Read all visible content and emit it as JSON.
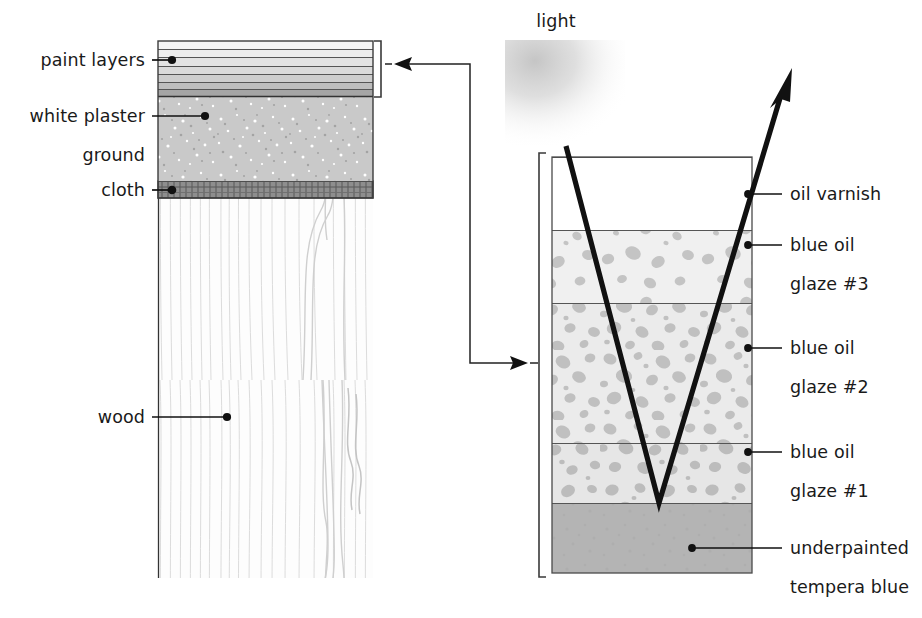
{
  "figure": {
    "background_color": "#ffffff",
    "ink_color": "#111111"
  },
  "light_label": {
    "text": "light",
    "x": 556,
    "y": 27
  },
  "left_diagram": {
    "name": "painting-cross-section",
    "block": {
      "x": 158,
      "y": 41,
      "width": 215,
      "height": 537
    },
    "labels": [
      {
        "id": "paint-layers",
        "text": "paint layers",
        "text_x": 145,
        "text_y": 66,
        "leader_from_x": 152,
        "leader_to_x": 172,
        "leader_y": 60,
        "dot_x": 172,
        "dot_y": 60
      },
      {
        "id": "white-plaster",
        "text": "white plaster",
        "text_x": 145,
        "text_y": 122,
        "leader_from_x": 152,
        "leader_to_x": 205,
        "leader_y": 116,
        "dot_x": 205,
        "dot_y": 116
      },
      {
        "id": "ground",
        "text": "ground",
        "text_x": 145,
        "text_y": 161,
        "leader_from_x": null,
        "leader_to_x": null,
        "leader_y": null,
        "dot_x": null,
        "dot_y": null
      },
      {
        "id": "cloth",
        "text": "cloth",
        "text_x": 145,
        "text_y": 196,
        "leader_from_x": 152,
        "leader_to_x": 172,
        "leader_y": 190,
        "dot_x": 172,
        "dot_y": 190
      },
      {
        "id": "wood",
        "text": "wood",
        "text_x": 145,
        "text_y": 423,
        "leader_from_x": 152,
        "leader_to_x": 227,
        "leader_y": 417,
        "dot_x": 227,
        "dot_y": 417
      }
    ],
    "layers": [
      {
        "id": "paint-band-1",
        "label": "paint layer 1",
        "y": 41,
        "height": 8,
        "color": "#f4f4f4"
      },
      {
        "id": "paint-band-2",
        "label": "paint layer 2",
        "y": 49,
        "height": 8,
        "color": "#ededed"
      },
      {
        "id": "paint-band-3",
        "label": "paint layer 3",
        "y": 57,
        "height": 9,
        "color": "#e4e4e4"
      },
      {
        "id": "paint-band-4",
        "label": "paint layer 4",
        "y": 66,
        "height": 8,
        "color": "#dcdcdc"
      },
      {
        "id": "paint-band-5",
        "label": "paint layer 5",
        "y": 74,
        "height": 8,
        "color": "#cfcfcf"
      },
      {
        "id": "paint-band-6",
        "label": "paint layer 6",
        "y": 82,
        "height": 7,
        "color": "#c2c2c2"
      },
      {
        "id": "paint-band-7",
        "label": "paint layer 7",
        "y": 89,
        "height": 8,
        "color": "#a8a8a8"
      },
      {
        "id": "ground-layer",
        "label": "white plaster ground",
        "y": 97,
        "height": 84,
        "color": "#c9c9c9"
      },
      {
        "id": "cloth-layer",
        "label": "cloth",
        "y": 181,
        "height": 17,
        "color": "#8a8a8a"
      },
      {
        "id": "wood-layer",
        "label": "wood",
        "y": 198,
        "height": 380,
        "color": "#fcfcfc"
      }
    ],
    "bracket": {
      "x": 381,
      "y_top": 41,
      "y_bottom": 97
    }
  },
  "connector": {
    "name": "magnification-connector",
    "description": "arrow linking paint layers bracket to magnified glaze stack",
    "arrow_left_tip_x": 394,
    "arrow_left_y": 64,
    "corner_x": 470,
    "arrow_right_tip_x": 528,
    "arrow_right_y": 363
  },
  "right_diagram": {
    "name": "glaze-stack-magnified",
    "block": {
      "x": 552,
      "y": 157,
      "width": 200,
      "height": 416
    },
    "bracket": {
      "x": 539,
      "y_top": 153,
      "y_bottom": 577
    },
    "layers": [
      {
        "id": "oil-varnish",
        "label": "oil varnish",
        "y": 157,
        "height": 73,
        "color": "#ffffff",
        "speckles": false,
        "speckle_density": 0
      },
      {
        "id": "blue-oil-glaze-3",
        "label": "blue oil glaze #3",
        "y": 230,
        "height": 73,
        "color": "#f0f0f0",
        "speckles": true,
        "speckle_density": 11
      },
      {
        "id": "blue-oil-glaze-2",
        "label": "blue oil glaze #2",
        "y": 303,
        "height": 140,
        "color": "#ebebeb",
        "speckles": true,
        "speckle_density": 30
      },
      {
        "id": "blue-oil-glaze-1",
        "label": "blue oil glaze #1",
        "y": 443,
        "height": 60,
        "color": "#e6e6e6",
        "speckles": true,
        "speckle_density": 20
      },
      {
        "id": "underpainted-tempera-blue",
        "label": "underpainted tempera blue",
        "y": 503,
        "height": 70,
        "color": "#b4b4b4",
        "speckles": false,
        "speckle_density": 0
      }
    ],
    "labels": [
      {
        "id": "oil-varnish",
        "lines": [
          "oil varnish"
        ],
        "text_x": 790,
        "text_y": 200,
        "leader_from_x": 782,
        "leader_to_x": 748,
        "leader_y": 194,
        "dot_x": 748,
        "dot_y": 194
      },
      {
        "id": "blue-oil-glaze-3",
        "lines": [
          "blue oil",
          "glaze #3"
        ],
        "text_x": 790,
        "text_y": 251,
        "leader_from_x": 782,
        "leader_to_x": 748,
        "leader_y": 245,
        "dot_x": 748,
        "dot_y": 245
      },
      {
        "id": "blue-oil-glaze-2",
        "lines": [
          "blue oil",
          "glaze #2"
        ],
        "text_x": 790,
        "text_y": 354,
        "leader_from_x": 782,
        "leader_to_x": 748,
        "leader_y": 348,
        "dot_x": 748,
        "dot_y": 348
      },
      {
        "id": "blue-oil-glaze-1",
        "lines": [
          "blue oil",
          "glaze #1"
        ],
        "text_x": 790,
        "text_y": 458,
        "leader_from_x": 782,
        "leader_to_x": 748,
        "leader_y": 452,
        "dot_x": 748,
        "dot_y": 452
      },
      {
        "id": "underpainted-tempera-blue",
        "lines": [
          "underpainted",
          "tempera blue"
        ],
        "text_x": 790,
        "text_y": 554,
        "leader_from_x": 782,
        "leader_to_x": 692,
        "leader_y": 548,
        "dot_x": 692,
        "dot_y": 548
      }
    ],
    "light_ray": {
      "name": "light-ray-path",
      "entry_x": 566,
      "entry_y": 146,
      "apex_x": 659,
      "apex_y": 503,
      "exit_x": 784,
      "exit_y": 88,
      "arrow_tip_x": 792,
      "arrow_tip_y": 70
    }
  }
}
